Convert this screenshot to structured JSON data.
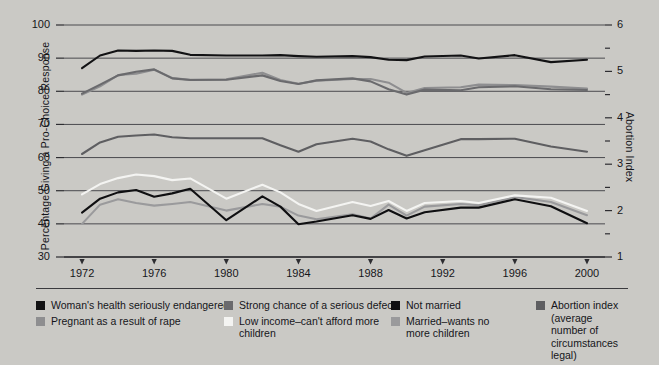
{
  "chart_data": {
    "type": "line",
    "title": "",
    "xlabel": "",
    "ylabel": "Percentage  Giving a Pro-Choice Response",
    "ylabel_right": "Abortion Index",
    "x": [
      1972,
      1973,
      1974,
      1975,
      1976,
      1977,
      1978,
      1980,
      1982,
      1983,
      1984,
      1985,
      1987,
      1988,
      1989,
      1990,
      1991,
      1993,
      1994,
      1996,
      1998,
      2000
    ],
    "xlim": [
      1971,
      2001
    ],
    "ylim": [
      30,
      100
    ],
    "ylim_right": [
      1,
      6
    ],
    "xticks": [
      1972,
      1976,
      1980,
      1984,
      1988,
      1992,
      1996,
      2000
    ],
    "yticks": [
      30,
      40,
      50,
      60,
      70,
      80,
      90,
      100
    ],
    "yticks_right": [
      1,
      2,
      3,
      4,
      5,
      6
    ],
    "yticks_right_minor": [
      1.5,
      2.5,
      3.5,
      4.5,
      5.5
    ],
    "grid": true,
    "legend_position": "bottom",
    "series": [
      {
        "name": "Woman's health seriously endangered",
        "color": "#121214",
        "axis": "left",
        "values": [
          87.0,
          90.8,
          92.3,
          92.2,
          92.3,
          92.2,
          91.0,
          90.8,
          90.8,
          90.9,
          90.6,
          90.4,
          90.6,
          90.3,
          89.5,
          89.4,
          90.5,
          90.8,
          89.9,
          90.9,
          88.8,
          89.5
        ]
      },
      {
        "name": "Pregnant as a result of rape",
        "color": "#8e8e90",
        "axis": "left",
        "values": [
          79.0,
          81.5,
          84.9,
          85.3,
          86.5,
          84.0,
          83.5,
          83.6,
          85.6,
          83.4,
          82.3,
          83.2,
          83.7,
          83.7,
          82.6,
          79.5,
          81.0,
          81.2,
          82.0,
          81.9,
          81.4,
          80.8
        ]
      },
      {
        "name": "Strong chance of a serious defect",
        "color": "#6a6a6d",
        "axis": "left",
        "values": [
          79.3,
          82.0,
          84.8,
          85.9,
          86.6,
          83.9,
          83.4,
          83.5,
          84.8,
          83.1,
          82.2,
          83.3,
          83.9,
          83.0,
          80.6,
          79.0,
          80.5,
          80.3,
          81.2,
          81.5,
          80.6,
          80.4
        ]
      },
      {
        "name": "Abortion index (average number of circumstances legal)",
        "color": "#5e5e61",
        "axis": "right",
        "values": [
          3.22,
          3.47,
          3.59,
          3.62,
          3.64,
          3.58,
          3.56,
          3.56,
          3.56,
          3.41,
          3.27,
          3.43,
          3.55,
          3.49,
          3.32,
          3.18,
          3.3,
          3.54,
          3.54,
          3.55,
          3.38,
          3.27
        ]
      },
      {
        "name": "Low income–can't afford more children",
        "color": "#f4f4f2",
        "axis": "left",
        "values": [
          48.9,
          52.0,
          53.8,
          54.9,
          54.4,
          53.2,
          53.7,
          47.6,
          51.8,
          49.5,
          46.0,
          43.9,
          46.6,
          45.4,
          46.9,
          43.9,
          46.3,
          46.9,
          46.3,
          48.6,
          47.9,
          43.9
        ]
      },
      {
        "name": "Not married",
        "color": "#0f0f11",
        "axis": "left",
        "values": [
          43.4,
          47.6,
          49.5,
          50.2,
          48.2,
          49.2,
          50.6,
          41.1,
          48.3,
          45.2,
          39.9,
          40.7,
          42.6,
          41.5,
          44.2,
          41.6,
          43.5,
          44.9,
          44.9,
          47.4,
          45.3,
          40.2
        ]
      },
      {
        "name": "Married–wants no more children",
        "color": "#9a9a9c",
        "axis": "left",
        "values": [
          40.0,
          45.8,
          47.4,
          46.3,
          45.5,
          46.0,
          46.6,
          44.0,
          46.0,
          45.2,
          42.5,
          41.4,
          42.9,
          41.6,
          45.8,
          42.5,
          45.2,
          46.0,
          45.6,
          48.1,
          46.6,
          42.6
        ]
      }
    ]
  },
  "axes": {
    "y_left_title": "Percentage  Giving a Pro-Choice Response",
    "y_right_title": "Abortion Index",
    "y_left_ticks": [
      "100",
      "90",
      "80",
      "70",
      "60",
      "50",
      "40",
      "30"
    ],
    "y_right_ticks": [
      "6",
      "5",
      "4",
      "3",
      "2",
      "1"
    ],
    "x_ticks": [
      "1972",
      "1976",
      "1980",
      "1984",
      "1988",
      "1992",
      "1996",
      "2000"
    ]
  },
  "legend": {
    "columns": [
      {
        "entries": [
          {
            "label": "Woman's health seriously endangered",
            "color": "#121214"
          },
          {
            "label": "Pregnant as a result of rape",
            "color": "#8e8e90"
          }
        ]
      },
      {
        "entries": [
          {
            "label": "Strong chance of a serious defect",
            "color": "#6a6a6d"
          },
          {
            "label": "Low income–can't afford more\nchildren",
            "color": "#f4f4f2"
          }
        ]
      },
      {
        "entries": [
          {
            "label": "Not married",
            "color": "#0f0f11"
          },
          {
            "label": "Married–wants no\nmore children",
            "color": "#9a9a9c"
          }
        ]
      },
      {
        "entries": [
          {
            "label": "Abortion index\n(average number of\ncircumstances legal)",
            "color": "#5e5e61"
          }
        ]
      }
    ]
  },
  "colors": {
    "background": "#cac9c5",
    "grid": "#4a4a4e",
    "axis": "#2d2d31"
  }
}
